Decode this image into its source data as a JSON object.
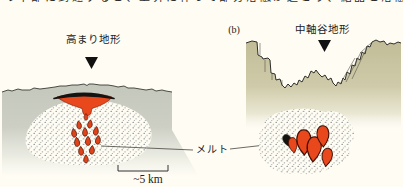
{
  "top_caption_fragment": "の下部に到達すると、上昇に伴って部分溶融が起こり、結晶と溶融体が混在する状態が生じる。",
  "panel_a": {
    "label": "高まり地形",
    "scale_label": "~5 km"
  },
  "panel_b": {
    "index_label": "(b)",
    "label": "中軸谷地形"
  },
  "melt_label": "メルト",
  "colors": {
    "background": "#fffdf3",
    "terrain_a_top": "#c4c7bc",
    "terrain_b_top": "#c1bc97",
    "melt_red": "#e8481c",
    "melt_lens_cap": "#141412",
    "outline": "#2e2e2a",
    "stipple_dot": "#49525c"
  }
}
